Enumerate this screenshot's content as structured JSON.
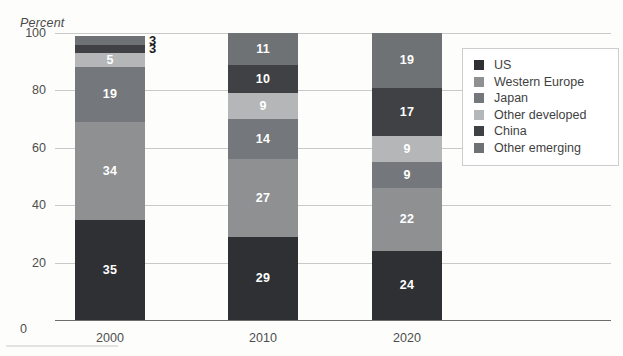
{
  "chart_data": {
    "type": "bar",
    "stacked": true,
    "title": "",
    "subtitle": "",
    "xlabel": "",
    "ylabel": "Percent",
    "categories": [
      "2000",
      "2010",
      "2020"
    ],
    "ylim": [
      0,
      100
    ],
    "yticks": [
      0,
      20,
      40,
      60,
      80,
      100
    ],
    "ytick_labels": [
      "0",
      "20",
      "40",
      "60",
      "80",
      "100"
    ],
    "grid": true,
    "legend_position": "right",
    "series": [
      {
        "name": "US",
        "color": "#2f3034",
        "values": [
          35,
          29,
          24
        ]
      },
      {
        "name": "Western Europe",
        "color": "#8e9092",
        "values": [
          34,
          27,
          22
        ]
      },
      {
        "name": "Japan",
        "color": "#74777b",
        "values": [
          19,
          14,
          9
        ]
      },
      {
        "name": "Other developed",
        "color": "#b4b6b7",
        "values": [
          5,
          9,
          9
        ]
      },
      {
        "name": "China",
        "color": "#3f4145",
        "values": [
          3,
          10,
          17
        ]
      },
      {
        "name": "Other emerging",
        "color": "#6f7275",
        "values": [
          3,
          11,
          19
        ]
      }
    ]
  },
  "axis": {
    "y_title": "Percent",
    "zero_label": "0"
  },
  "legend": {
    "items": [
      {
        "label": "US"
      },
      {
        "label": "Western Europe"
      },
      {
        "label": "Japan"
      },
      {
        "label": "Other developed"
      },
      {
        "label": "China"
      },
      {
        "label": "Other emerging"
      }
    ]
  }
}
